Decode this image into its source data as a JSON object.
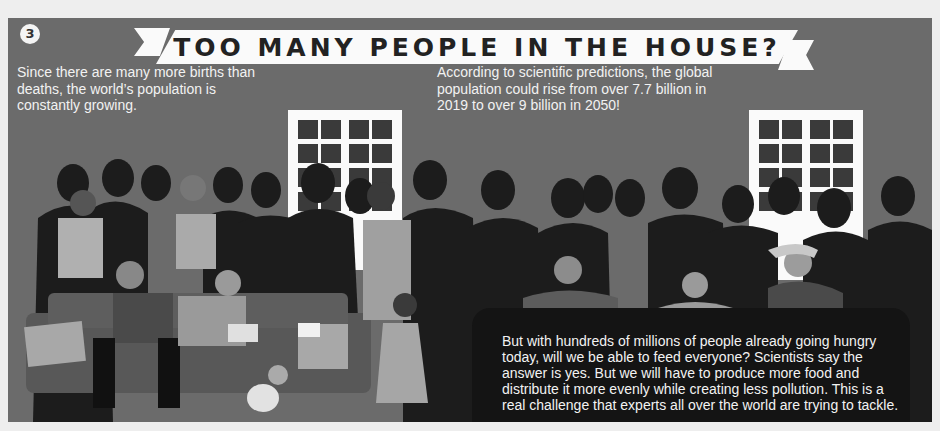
{
  "section_badge": "3",
  "title": "TOO MANY PEOPLE IN THE HOUSE?",
  "intro_left": "Since there are many more births than deaths, the world’s population is constantly growing.",
  "intro_right": "According to scientific predictions, the global population could rise from over 7.7 billion in 2019 to over 9 billion in 2050!",
  "bottom_text": "But with hundreds of millions of people already going hungry today, will we be able to feed everyone? Scientists say the answer is yes. But we will have to produce more food and distribute it more evenly while creating less pollution. This is a real challenge that experts all over the world are trying to tackle.",
  "illustration": {
    "description": "Crowded house scene with silhouetted people, a sofa with family members, children eating at a table with empty plates, and two windows",
    "colors": {
      "background": "#6b6b6b",
      "silhouette": "#1c1c1c",
      "banner": "#fafafa",
      "text": "#f2f2f2",
      "border": "#eeeeee"
    }
  }
}
